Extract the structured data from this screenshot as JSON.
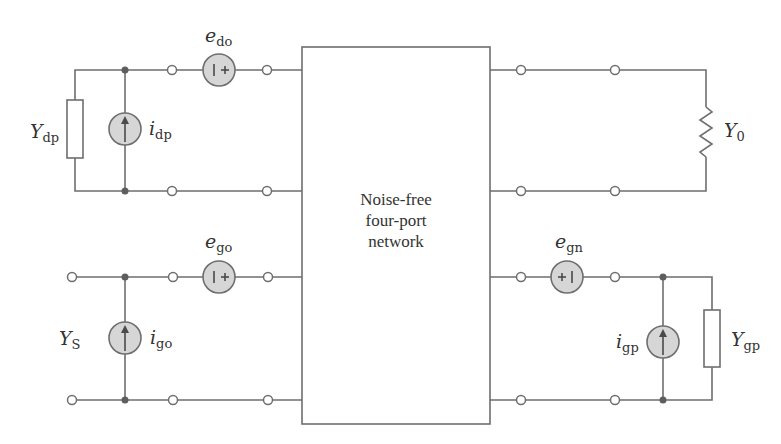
{
  "figure": {
    "type": "noise-equivalent circuit",
    "colors": {
      "wire": "#6e6e6e",
      "source_fill": "#d6d6d6",
      "junction": "#5e5e5e",
      "text": "#333333",
      "background": "#ffffff"
    }
  },
  "network": {
    "lines": [
      "Noise-free",
      "four-port",
      "network"
    ]
  },
  "top_left_port": {
    "admittance": {
      "main": "Y",
      "sub": "dp"
    },
    "current_source": {
      "main": "i",
      "sub": "dp"
    },
    "voltage_source": {
      "main": "e",
      "sub": "do",
      "polarity": "| +"
    }
  },
  "top_right_port": {
    "load": {
      "main": "Y",
      "sub": "0"
    }
  },
  "bottom_left_port": {
    "source_admittance": {
      "main": "Y",
      "sub": "S"
    },
    "current_source": {
      "main": "i",
      "sub": "go"
    },
    "voltage_source": {
      "main": "e",
      "sub": "go",
      "polarity": "| +"
    }
  },
  "bottom_right_port": {
    "voltage_source": {
      "main": "e",
      "sub": "gn",
      "polarity": "+ |"
    },
    "current_source": {
      "main": "i",
      "sub": "gp"
    },
    "admittance": {
      "main": "Y",
      "sub": "gp"
    }
  }
}
